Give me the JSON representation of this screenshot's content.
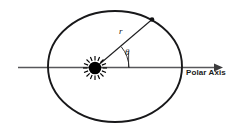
{
  "figure": {
    "labels": {
      "polar_axis": "Polar Axis",
      "radius": "r",
      "angle": "θ"
    },
    "colors": {
      "stroke": "#1a1a1a",
      "axis": "#4d4d4d",
      "background": "#ffffff",
      "sun": "#000000"
    },
    "geometry": {
      "ellipse": {
        "cx": 115,
        "cy": 66.5,
        "rx": 67,
        "ry": 55.5,
        "stroke_width": 1.9
      },
      "polar_axis_line": {
        "x1": 18,
        "y1": 67.5,
        "x2": 222,
        "y2": 67.5,
        "arrow": "right"
      },
      "focus_sun": {
        "cx": 95,
        "cy": 68,
        "core_r": 6.2,
        "ray_count": 16,
        "ray_inner": 7.5,
        "ray_outer": 12
      },
      "radius_vector": {
        "x1": 95,
        "y1": 68,
        "x2": 152,
        "y2": 19.5,
        "endpoint_dot_r": 2.2
      },
      "angle_arc": {
        "center_x": 95,
        "center_y": 68,
        "radius": 34,
        "start_deg": 0,
        "end_deg": 40
      },
      "theta_leader": {
        "x1": 128.5,
        "y1": 52,
        "x2": 128.5,
        "y2": 67
      }
    }
  }
}
